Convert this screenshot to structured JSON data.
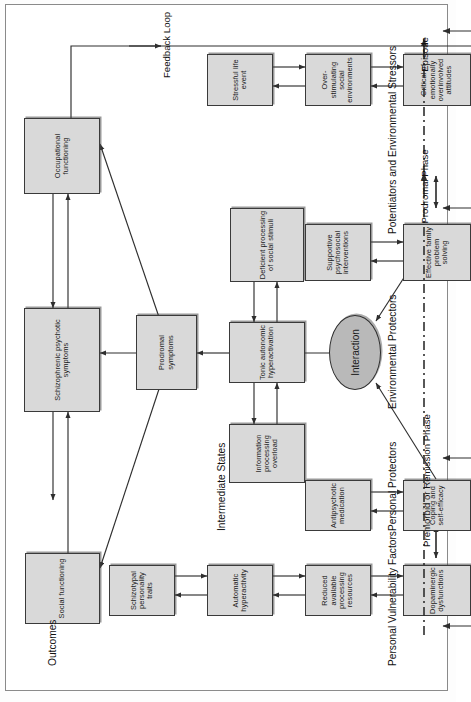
{
  "figure": {
    "caption": "",
    "orientation": "rotated-90-ccw",
    "box_fill": "#d9d9d9",
    "ellipse_fill": "#b9b9b9",
    "line_color": "#2e2e2e"
  },
  "bands": {
    "outcomes": "Outcomes",
    "intermediate_states": "Intermediate States",
    "personal_vulnerability_factors": "Personal Vulnerability Factors",
    "personal_protectors": "Personal Protectors",
    "environmental_protectors": "Environmental Protectors",
    "potentiators_and_environmental_stressors": "Potentiators and Environmental Stressors"
  },
  "nodes": {
    "social_functioning": "Social functioning",
    "schizophrenic_psychotic_symptoms": "Schizophrenic psychotic symptoms",
    "occupational_functioning": "Occupational functioning",
    "prodromal_symptoms": "Prodromal symptoms",
    "information_processing_overload": "Information processing overload",
    "tonic_autonomic_hyperactivation": "Tonic autonomic hyperactivation",
    "deficient_processing_of_social_stimuli": "Deficient processing of social stimuli",
    "interaction": "Interaction",
    "schizotypal_personality_traits": "Schizotypal personality traits",
    "automatic_hyperactivity": "Automatic hyperactivity",
    "reduced_available_processing_resources": "Reduced available processing resources",
    "dopaminergic_dysfunctions": "Dopaminergic dysfunctions",
    "antipsychotic_medication": "Antipsychotic medication",
    "coping_and_self_efficacy": "Coping and self-efficacy",
    "supportive_psychosocial_interventions": "Supportive psychosocial interventions",
    "effective_family_problem_solving": "Effective family problem solving",
    "stressful_life_event": "Stressful life event",
    "over_stimulating_social_environments": "Over-stimulating social environments",
    "critical_of_emotionally_overinvolved_attitudes": "Critical of emotionally overinvolved attitudes"
  },
  "annotations": {
    "feedback_loop": "Feedback Loop"
  },
  "timeline": {
    "phases": [
      "Premorbid or Remission Phase",
      "Prodromal Phase",
      "Episode"
    ]
  }
}
